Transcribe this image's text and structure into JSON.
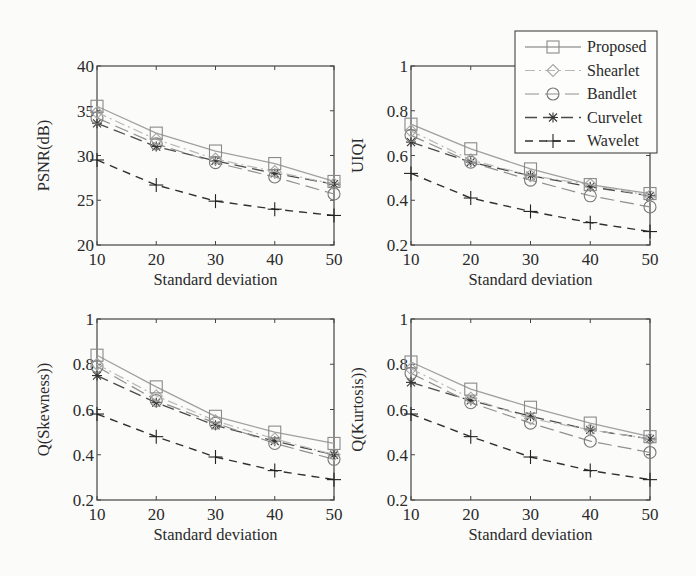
{
  "figure": {
    "legend": {
      "position": "top-right",
      "entries": [
        {
          "name": "Proposed",
          "marker": "square",
          "line": "solid",
          "color": "#9a9a9a"
        },
        {
          "name": "Shearlet",
          "marker": "diamond",
          "line": "dash-dot",
          "color": "#b0b0b0"
        },
        {
          "name": "Bandlet",
          "marker": "circle",
          "line": "dashed-long",
          "color": "#8c8c8c"
        },
        {
          "name": "Curvelet",
          "marker": "star",
          "line": "dashed",
          "color": "#555555"
        },
        {
          "name": "Wavelet",
          "marker": "plus",
          "line": "dashed",
          "color": "#333333"
        }
      ]
    }
  },
  "chart_data": [
    {
      "type": "line",
      "title": "",
      "xlabel": "Standard deviation",
      "ylabel": "PSNR(dB)",
      "x": [
        10,
        20,
        30,
        40,
        50
      ],
      "xlim": [
        10,
        50
      ],
      "ylim": [
        20,
        40
      ],
      "xticks": [
        "10",
        "20",
        "30",
        "40",
        "50"
      ],
      "yticks": [
        "20",
        "25",
        "30",
        "35",
        "40"
      ],
      "grid": false,
      "series": [
        {
          "name": "Proposed",
          "values": [
            35.5,
            32.5,
            30.5,
            29.1,
            27.1
          ]
        },
        {
          "name": "Shearlet",
          "values": [
            34.8,
            31.8,
            29.6,
            28.2,
            26.8
          ]
        },
        {
          "name": "Bandlet",
          "values": [
            34.2,
            31.3,
            29.2,
            27.6,
            25.7
          ]
        },
        {
          "name": "Curvelet",
          "values": [
            33.6,
            31.0,
            29.4,
            28.0,
            26.8
          ]
        },
        {
          "name": "Wavelet",
          "values": [
            29.5,
            26.7,
            24.9,
            24.0,
            23.3
          ]
        }
      ]
    },
    {
      "type": "line",
      "title": "",
      "xlabel": "Standard deviation",
      "ylabel": "UIQI",
      "x": [
        10,
        20,
        30,
        40,
        50
      ],
      "xlim": [
        10,
        50
      ],
      "ylim": [
        0.2,
        1
      ],
      "xticks": [
        "10",
        "20",
        "30",
        "40",
        "50"
      ],
      "yticks": [
        "0.2",
        "0.4",
        "0.6",
        "0.8",
        "1"
      ],
      "grid": false,
      "series": [
        {
          "name": "Proposed",
          "values": [
            0.74,
            0.63,
            0.54,
            0.47,
            0.43
          ]
        },
        {
          "name": "Shearlet",
          "values": [
            0.71,
            0.58,
            0.51,
            0.47,
            0.42
          ]
        },
        {
          "name": "Bandlet",
          "values": [
            0.69,
            0.57,
            0.49,
            0.42,
            0.37
          ]
        },
        {
          "name": "Curvelet",
          "values": [
            0.66,
            0.57,
            0.51,
            0.46,
            0.42
          ]
        },
        {
          "name": "Wavelet",
          "values": [
            0.52,
            0.41,
            0.35,
            0.3,
            0.26
          ]
        }
      ]
    },
    {
      "type": "line",
      "title": "",
      "xlabel": "Standard deviation",
      "ylabel": "Q(Skewness))",
      "x": [
        10,
        20,
        30,
        40,
        50
      ],
      "xlim": [
        10,
        50
      ],
      "ylim": [
        0.2,
        1
      ],
      "xticks": [
        "10",
        "20",
        "30",
        "40",
        "50"
      ],
      "yticks": [
        "0.2",
        "0.4",
        "0.6",
        "0.8",
        "1"
      ],
      "grid": false,
      "series": [
        {
          "name": "Proposed",
          "values": [
            0.84,
            0.7,
            0.57,
            0.5,
            0.45
          ]
        },
        {
          "name": "Shearlet",
          "values": [
            0.8,
            0.66,
            0.55,
            0.47,
            0.4
          ]
        },
        {
          "name": "Bandlet",
          "values": [
            0.79,
            0.64,
            0.54,
            0.45,
            0.38
          ]
        },
        {
          "name": "Curvelet",
          "values": [
            0.75,
            0.63,
            0.53,
            0.46,
            0.4
          ]
        },
        {
          "name": "Wavelet",
          "values": [
            0.58,
            0.48,
            0.39,
            0.33,
            0.29
          ]
        }
      ]
    },
    {
      "type": "line",
      "title": "",
      "xlabel": "Standard deviation",
      "ylabel": "Q(Kurtosis))",
      "x": [
        10,
        20,
        30,
        40,
        50
      ],
      "xlim": [
        10,
        50
      ],
      "ylim": [
        0.2,
        1
      ],
      "xticks": [
        "10",
        "20",
        "30",
        "40",
        "50"
      ],
      "yticks": [
        "0.2",
        "0.4",
        "0.6",
        "0.8",
        "1"
      ],
      "grid": false,
      "series": [
        {
          "name": "Proposed",
          "values": [
            0.81,
            0.69,
            0.61,
            0.54,
            0.48
          ]
        },
        {
          "name": "Shearlet",
          "values": [
            0.78,
            0.65,
            0.56,
            0.51,
            0.47
          ]
        },
        {
          "name": "Bandlet",
          "values": [
            0.76,
            0.63,
            0.54,
            0.46,
            0.41
          ]
        },
        {
          "name": "Curvelet",
          "values": [
            0.72,
            0.64,
            0.57,
            0.51,
            0.47
          ]
        },
        {
          "name": "Wavelet",
          "values": [
            0.58,
            0.48,
            0.39,
            0.33,
            0.29
          ]
        }
      ]
    }
  ]
}
